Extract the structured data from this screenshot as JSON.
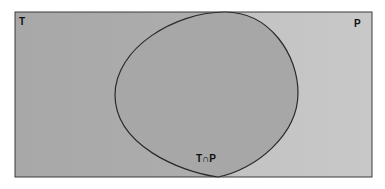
{
  "diagram": {
    "type": "venn",
    "sets": [
      {
        "id": "T",
        "label": "T",
        "region": "left rectangle area"
      },
      {
        "id": "P",
        "label": "P",
        "region": "right rectangle area"
      }
    ],
    "intersection": {
      "label": "T∩P"
    },
    "colors": {
      "left": "#a9a9a9",
      "right": "#c6c6c6",
      "blob": "#a7a7a7",
      "stroke": "#2a2a2a"
    }
  }
}
